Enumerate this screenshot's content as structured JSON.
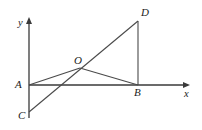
{
  "figure": {
    "kind": "coordinate-plane-geometry-diagram",
    "background_color": "#ffffff",
    "stroke_color": "#4a4a4a",
    "axis_color": "#3a3a3a",
    "label_color": "#1c1c1c",
    "width": 202,
    "height": 130
  },
  "axes": {
    "x_label": "x",
    "y_label": "y",
    "origin": {
      "x": 29,
      "y": 85
    },
    "x_axis": {
      "x1": 29,
      "y1": 85,
      "x2": 190,
      "y2": 85
    },
    "y_axis": {
      "x1": 29,
      "y1": 17,
      "x2": 29,
      "y2": 118
    }
  },
  "points": [
    {
      "name": "A",
      "label": "A",
      "x": 29,
      "y": 85,
      "label_x": 15,
      "label_y": 79
    },
    {
      "name": "B",
      "label": "B",
      "x": 138,
      "y": 85,
      "label_x": 134,
      "label_y": 87
    },
    {
      "name": "C",
      "label": "C",
      "x": 29,
      "y": 112,
      "label_x": 18,
      "label_y": 110
    },
    {
      "name": "D",
      "label": "D",
      "x": 138,
      "y": 21,
      "label_x": 141,
      "label_y": 7
    },
    {
      "name": "O",
      "label": "O",
      "x": 80,
      "y": 68,
      "label_x": 74,
      "label_y": 55
    }
  ],
  "segments": [
    {
      "name": "segment-C-D",
      "from": "C",
      "to": "D",
      "x1": 29,
      "y1": 112,
      "x2": 138,
      "y2": 21
    },
    {
      "name": "segment-A-O",
      "from": "A",
      "to": "O",
      "x1": 29,
      "y1": 85,
      "x2": 80,
      "y2": 68
    },
    {
      "name": "segment-O-B",
      "from": "O",
      "to": "B",
      "x1": 80,
      "y1": 68,
      "x2": 138,
      "y2": 85
    },
    {
      "name": "segment-B-D",
      "from": "B",
      "to": "D",
      "x1": 138,
      "y1": 85,
      "x2": 138,
      "y2": 21
    }
  ]
}
